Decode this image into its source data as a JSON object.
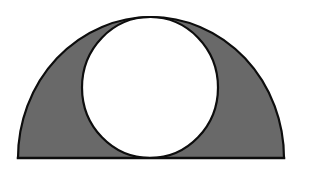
{
  "figure": {
    "background_color": "#ffffff",
    "canvas": {
      "width": 309,
      "height": 170
    },
    "stroke": {
      "color": "#0d0d0d",
      "width": 2.2
    },
    "shapes": [
      {
        "name": "outer-semicircle",
        "type": "semicircle",
        "fill_color": "#696969",
        "stroke_color": "#0d0d0d",
        "baseline_y": 158,
        "left_x": 18,
        "right_x": 284,
        "center_x": 151,
        "radius_x": 133,
        "radius_y": 141,
        "apex_y": 17
      },
      {
        "name": "inner-circle",
        "type": "circle",
        "fill_color": "#ffffff",
        "stroke_color": "#0d0d0d",
        "center_x": 150,
        "center_y": 87.5,
        "radius_x": 68,
        "radius_y": 70.5,
        "top_y": 17,
        "bottom_y": 158,
        "left_x": 82,
        "right_x": 218,
        "tangent_to": [
          "baseline",
          "outer-arc-apex"
        ]
      },
      {
        "name": "baseline",
        "type": "line",
        "stroke_color": "#0d0d0d",
        "x1": 18,
        "y1": 158,
        "x2": 284,
        "y2": 158
      }
    ],
    "shaded_region_label": "",
    "labels": []
  }
}
